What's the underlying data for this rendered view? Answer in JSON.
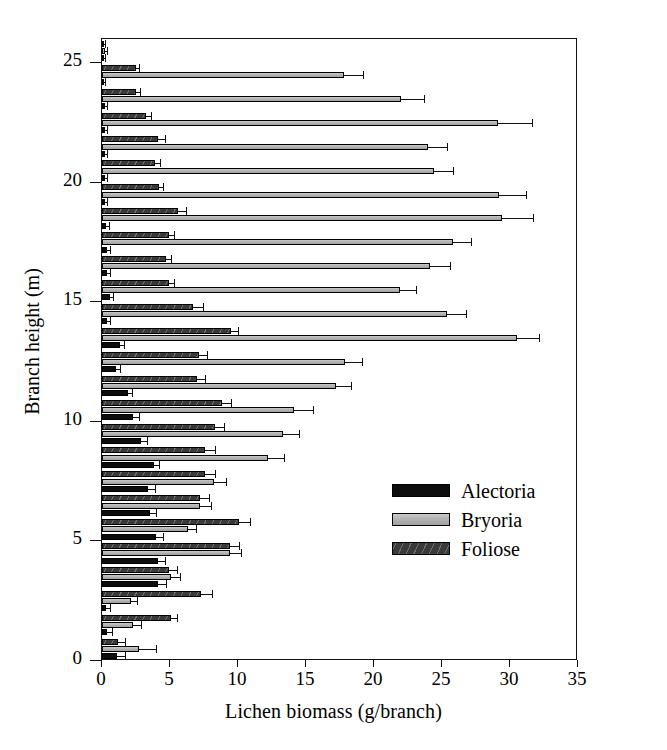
{
  "chart_data": {
    "type": "bar",
    "orientation": "horizontal",
    "title": "",
    "xlabel": "Lichen biomass (g/branch)",
    "ylabel": "Branch height (m)",
    "xlim": [
      0,
      35
    ],
    "ylim": [
      0,
      26
    ],
    "xticks": [
      0,
      5,
      10,
      15,
      20,
      25,
      30,
      35
    ],
    "yticks": [
      0,
      5,
      10,
      15,
      20,
      25
    ],
    "grid": false,
    "legend_position": "center-right",
    "error_bars": "standard error",
    "categories": [
      1,
      2,
      3,
      4,
      5,
      6,
      7,
      8,
      9,
      10,
      11,
      12,
      13,
      14,
      15,
      16,
      17,
      18,
      19,
      20,
      21,
      22,
      23,
      24,
      25,
      26
    ],
    "series": [
      {
        "name": "Alectoria",
        "color": "#0d0d0d",
        "values": [
          1.1,
          0.4,
          0.3,
          4.1,
          4.1,
          4.0,
          3.5,
          3.4,
          3.8,
          2.9,
          2.3,
          1.9,
          1.0,
          1.3,
          0.4,
          0.6,
          0.4,
          0.4,
          0.3,
          0.2,
          0.2,
          0.2,
          0.2,
          0.2,
          0.1,
          0.1
        ],
        "errors": [
          0.6,
          0.3,
          0.3,
          0.6,
          0.5,
          0.5,
          0.5,
          0.5,
          0.4,
          0.4,
          0.4,
          0.3,
          0.3,
          0.3,
          0.2,
          0.2,
          0.2,
          0.2,
          0.2,
          0.2,
          0.2,
          0.2,
          0.2,
          0.2,
          0.1,
          0.1
        ]
      },
      {
        "name": "Bryoria",
        "color": "#b4b4b4",
        "values": [
          2.7,
          2.3,
          2.1,
          5.1,
          9.4,
          6.3,
          7.2,
          8.2,
          12.2,
          13.3,
          14.1,
          17.2,
          17.9,
          30.5,
          25.4,
          21.9,
          24.1,
          25.8,
          29.4,
          29.2,
          24.4,
          24.0,
          29.1,
          22.0,
          17.8,
          0.2
        ],
        "errors": [
          1.3,
          0.6,
          0.5,
          0.6,
          0.8,
          0.6,
          0.8,
          0.9,
          1.2,
          1.2,
          1.4,
          1.1,
          1.2,
          1.6,
          1.4,
          1.2,
          1.5,
          1.3,
          2.3,
          2.0,
          1.4,
          1.4,
          2.5,
          1.7,
          1.4,
          0.2
        ]
      },
      {
        "name": "Foliose",
        "color": "#4a4a4a",
        "values": [
          1.2,
          5.1,
          7.3,
          4.9,
          9.4,
          10.1,
          7.2,
          7.6,
          7.6,
          8.3,
          8.8,
          7.0,
          7.1,
          9.5,
          6.7,
          4.9,
          4.7,
          4.9,
          5.6,
          4.2,
          3.9,
          4.1,
          3.2,
          2.5,
          2.5,
          0.1
        ],
        "errors": [
          0.5,
          0.4,
          0.8,
          0.6,
          0.7,
          0.8,
          0.7,
          0.7,
          0.7,
          0.7,
          0.7,
          0.6,
          0.6,
          0.5,
          0.7,
          0.4,
          0.4,
          0.4,
          0.6,
          0.3,
          0.4,
          0.5,
          0.4,
          0.3,
          0.2,
          0.1
        ]
      }
    ]
  },
  "axes": {
    "x_title": "Lichen biomass (g/branch)",
    "y_title": "Branch height (m)",
    "x_tick_labels": [
      "0",
      "5",
      "10",
      "15",
      "20",
      "25",
      "30",
      "35"
    ],
    "y_tick_labels": [
      "0",
      "5",
      "10",
      "15",
      "20",
      "25"
    ]
  },
  "legend": {
    "items": [
      {
        "label": "Alectoria",
        "swatch": "solid-black-swatch"
      },
      {
        "label": "Bryoria",
        "swatch": "light-gray-swatch"
      },
      {
        "label": "Foliose",
        "swatch": "dark-hatched-swatch"
      }
    ]
  }
}
